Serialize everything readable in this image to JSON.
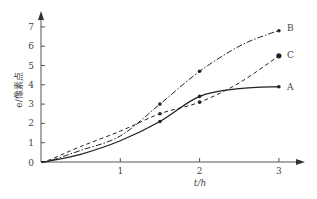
{
  "chart_data": {
    "type": "line",
    "title": "",
    "xlabel": "t/h",
    "ylabel": "e/像素点",
    "xlim": [
      0,
      3.5
    ],
    "ylim": [
      0,
      7.5
    ],
    "x_ticks": [
      "1",
      "2",
      "3"
    ],
    "y_ticks": [
      "0",
      "1",
      "2",
      "3",
      "4",
      "5",
      "6",
      "7"
    ],
    "grid": false,
    "legend": "inline labels at line ends",
    "series": [
      {
        "name": "A",
        "style": "solid",
        "x": [
          0,
          0.1,
          0.5,
          1.0,
          1.5,
          2.0,
          2.5,
          3.0
        ],
        "y": [
          0,
          0.05,
          0.4,
          1.1,
          2.1,
          3.4,
          3.8,
          3.9
        ]
      },
      {
        "name": "B",
        "style": "dash-dot",
        "x": [
          0,
          0.1,
          0.5,
          1.0,
          1.5,
          2.0,
          2.5,
          2.85,
          3.0
        ],
        "y": [
          0,
          0.05,
          0.6,
          1.35,
          3.0,
          4.7,
          6.0,
          6.6,
          6.8
        ]
      },
      {
        "name": "C",
        "style": "dashed",
        "x": [
          0,
          0.1,
          0.5,
          1.0,
          1.5,
          2.0,
          2.5,
          3.0
        ],
        "y": [
          0,
          0.1,
          0.8,
          1.6,
          2.5,
          3.1,
          4.1,
          5.5
        ]
      }
    ]
  },
  "labels": {
    "origin": "0",
    "x_axis_label": "t/h",
    "y_axis_label": "e/像素点",
    "series_a": "A",
    "series_b": "B",
    "series_c": "C"
  }
}
